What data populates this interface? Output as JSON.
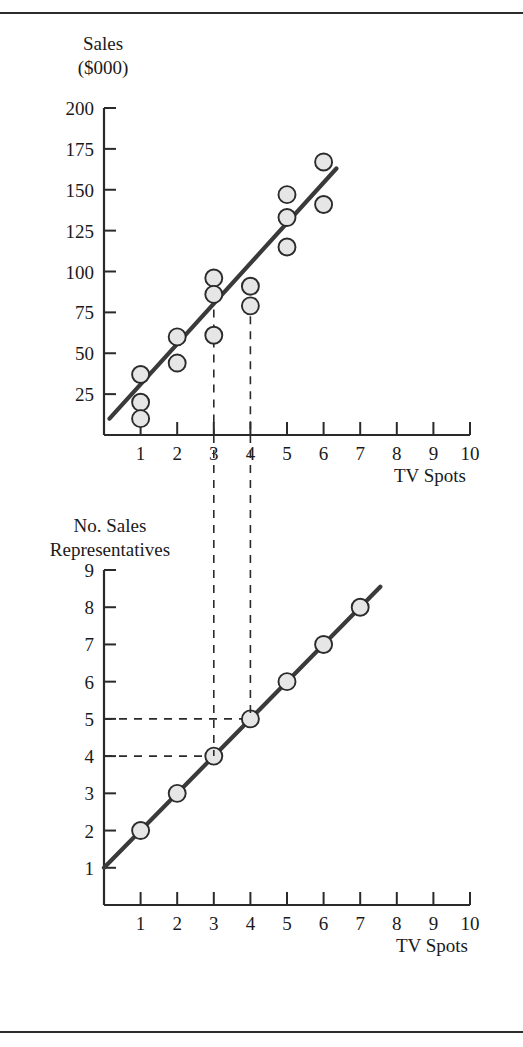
{
  "figure": {
    "top_rule": "horizontal-rule",
    "bottom_rule": "horizontal-rule"
  },
  "chart_data": [
    {
      "id": "sales-vs-tv-spots",
      "type": "scatter",
      "title": "",
      "ylabel_line1": "Sales",
      "ylabel_line2": "($000)",
      "xlabel": "TV Spots",
      "xlim": [
        0,
        10
      ],
      "ylim": [
        0,
        200
      ],
      "xticks": [
        1,
        2,
        3,
        4,
        5,
        6,
        7,
        8,
        9,
        10
      ],
      "xticklabels": [
        "1",
        "2",
        "3",
        "4",
        "5",
        "6",
        "7",
        "8",
        "9",
        "10"
      ],
      "yticks": [
        25,
        50,
        75,
        100,
        125,
        150,
        175,
        200
      ],
      "yticklabels": [
        "25",
        "50",
        "75",
        "100",
        "125",
        "150",
        "175",
        "200"
      ],
      "grid": false,
      "legend": "none",
      "points": [
        {
          "x": 1,
          "y": 37
        },
        {
          "x": 1,
          "y": 20
        },
        {
          "x": 1,
          "y": 10
        },
        {
          "x": 2,
          "y": 60
        },
        {
          "x": 2,
          "y": 44
        },
        {
          "x": 3,
          "y": 96
        },
        {
          "x": 3,
          "y": 86
        },
        {
          "x": 3,
          "y": 61
        },
        {
          "x": 4,
          "y": 91
        },
        {
          "x": 4,
          "y": 79
        },
        {
          "x": 5,
          "y": 147
        },
        {
          "x": 5,
          "y": 133
        },
        {
          "x": 5,
          "y": 115
        },
        {
          "x": 6,
          "y": 167
        },
        {
          "x": 6,
          "y": 141
        }
      ],
      "fit_line": {
        "x1": 0.15,
        "y1": 10,
        "x2": 6.35,
        "y2": 163
      },
      "guides": [
        {
          "orientation": "vertical",
          "x": 3,
          "from_y": 0,
          "to_y": 86
        },
        {
          "orientation": "vertical",
          "x": 4,
          "from_y": 0,
          "to_y": 91
        }
      ]
    },
    {
      "id": "sales-representatives-vs-tv-spots",
      "type": "line",
      "title": "",
      "ylabel_line1": "No. Sales",
      "ylabel_line2": "Representatives",
      "xlabel": "TV Spots",
      "xlim": [
        0,
        10
      ],
      "ylim": [
        0,
        9
      ],
      "xticks": [
        1,
        2,
        3,
        4,
        5,
        6,
        7,
        8,
        9,
        10
      ],
      "xticklabels": [
        "1",
        "2",
        "3",
        "4",
        "5",
        "6",
        "7",
        "8",
        "9",
        "10"
      ],
      "yticks": [
        1,
        2,
        3,
        4,
        5,
        6,
        7,
        8,
        9
      ],
      "yticklabels": [
        "1",
        "2",
        "3",
        "4",
        "5",
        "6",
        "7",
        "8",
        "9"
      ],
      "grid": false,
      "legend": "none",
      "points": [
        {
          "x": 1,
          "y": 2
        },
        {
          "x": 2,
          "y": 3
        },
        {
          "x": 3,
          "y": 4
        },
        {
          "x": 4,
          "y": 5
        },
        {
          "x": 5,
          "y": 6
        },
        {
          "x": 6,
          "y": 7
        },
        {
          "x": 7,
          "y": 8
        }
      ],
      "fit_line": {
        "x1": 0.0,
        "y1": 1.0,
        "x2": 7.55,
        "y2": 8.55
      },
      "guides": [
        {
          "orientation": "horizontal",
          "y": 4,
          "from_x": 0,
          "to_x": 3
        },
        {
          "orientation": "horizontal",
          "y": 5,
          "from_x": 0,
          "to_x": 4
        }
      ]
    }
  ],
  "connectors": [
    {
      "label": "tv-spots-3-link",
      "from_chart": "sales-vs-tv-spots",
      "to_chart": "sales-representatives-vs-tv-spots",
      "x": 3
    },
    {
      "label": "tv-spots-4-link",
      "from_chart": "sales-vs-tv-spots",
      "to_chart": "sales-representatives-vs-tv-spots",
      "x": 4
    }
  ]
}
